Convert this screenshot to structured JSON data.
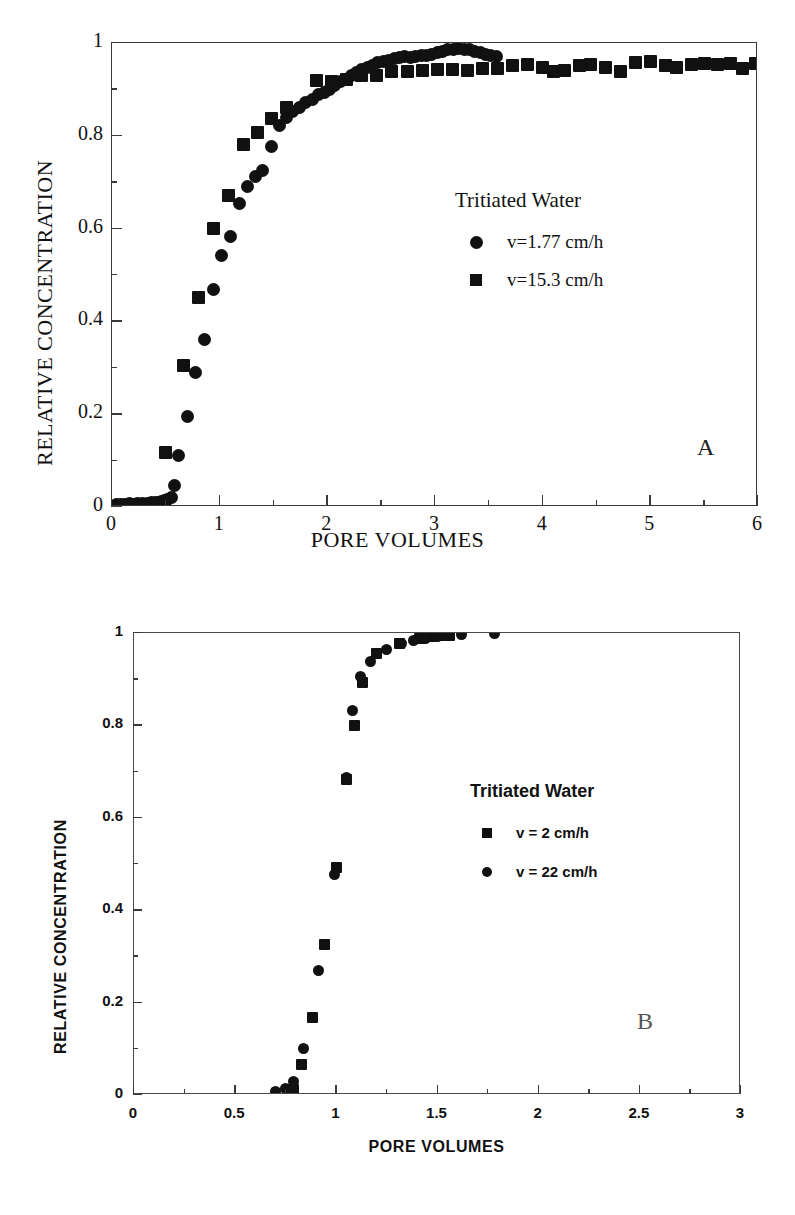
{
  "figure": {
    "panels": [
      "A",
      "B"
    ],
    "background": "#ffffff",
    "ink": "#111111"
  },
  "panelA": {
    "letter": "A",
    "legend": {
      "title": "Tritiated Water",
      "entries": [
        {
          "marker": "circle",
          "label": "v=1.77 cm/h"
        },
        {
          "marker": "square",
          "label": "v=15.3 cm/h"
        }
      ]
    },
    "chart_data": {
      "type": "scatter",
      "title": "",
      "xlabel": "PORE VOLUMES",
      "ylabel": "RELATIVE CONCENTRATION",
      "xlim": [
        0,
        6
      ],
      "ylim": [
        0,
        1
      ],
      "xticks": [
        0,
        1,
        2,
        3,
        4,
        5,
        6
      ],
      "xticklabels": [
        "0",
        "1",
        "2",
        "3",
        "4",
        "5",
        "6"
      ],
      "yticks": [
        0,
        0.2,
        0.4,
        0.6,
        0.8,
        1
      ],
      "yticklabels": [
        "0",
        "0.2",
        "0.4",
        "0.6",
        "0.8",
        "1"
      ],
      "xminorstep": 0.5,
      "yminorstep": 0.1,
      "grid": false,
      "legend_position": "center-right",
      "series": [
        {
          "name": "v=1.77 cm/h",
          "marker": "circle",
          "points": [
            [
              0.04,
              0.005
            ],
            [
              0.08,
              0.006
            ],
            [
              0.12,
              0.006
            ],
            [
              0.16,
              0.007
            ],
            [
              0.2,
              0.006
            ],
            [
              0.24,
              0.007
            ],
            [
              0.28,
              0.008
            ],
            [
              0.33,
              0.007
            ],
            [
              0.37,
              0.009
            ],
            [
              0.4,
              0.01
            ],
            [
              0.43,
              0.01
            ],
            [
              0.46,
              0.012
            ],
            [
              0.49,
              0.013
            ],
            [
              0.52,
              0.016
            ],
            [
              0.55,
              0.02
            ],
            [
              0.58,
              0.047
            ],
            [
              0.62,
              0.112
            ],
            [
              0.7,
              0.196
            ],
            [
              0.78,
              0.289
            ],
            [
              0.86,
              0.362
            ],
            [
              0.94,
              0.468
            ],
            [
              1.02,
              0.543
            ],
            [
              1.1,
              0.582
            ],
            [
              1.18,
              0.655
            ],
            [
              1.26,
              0.69
            ],
            [
              1.33,
              0.712
            ],
            [
              1.4,
              0.725
            ],
            [
              1.48,
              0.776
            ],
            [
              1.56,
              0.822
            ],
            [
              1.62,
              0.84
            ],
            [
              1.68,
              0.852
            ],
            [
              1.74,
              0.862
            ],
            [
              1.8,
              0.872
            ],
            [
              1.86,
              0.879
            ],
            [
              1.92,
              0.888
            ],
            [
              1.97,
              0.893
            ],
            [
              2.02,
              0.9
            ],
            [
              2.07,
              0.908
            ],
            [
              2.12,
              0.916
            ],
            [
              2.17,
              0.922
            ],
            [
              2.22,
              0.93
            ],
            [
              2.27,
              0.936
            ],
            [
              2.32,
              0.942
            ],
            [
              2.37,
              0.948
            ],
            [
              2.42,
              0.952
            ],
            [
              2.47,
              0.957
            ],
            [
              2.52,
              0.96
            ],
            [
              2.57,
              0.963
            ],
            [
              2.62,
              0.967
            ],
            [
              2.67,
              0.968
            ],
            [
              2.72,
              0.97
            ],
            [
              2.77,
              0.969
            ],
            [
              2.82,
              0.971
            ],
            [
              2.87,
              0.972
            ],
            [
              2.92,
              0.974
            ],
            [
              2.97,
              0.976
            ],
            [
              3.02,
              0.979
            ],
            [
              3.07,
              0.982
            ],
            [
              3.12,
              0.985
            ],
            [
              3.17,
              0.987
            ],
            [
              3.22,
              0.988
            ],
            [
              3.27,
              0.986
            ],
            [
              3.32,
              0.985
            ],
            [
              3.37,
              0.982
            ],
            [
              3.42,
              0.979
            ],
            [
              3.47,
              0.976
            ],
            [
              3.52,
              0.973
            ],
            [
              3.57,
              0.97
            ]
          ]
        },
        {
          "name": "v=15.3 cm/h",
          "marker": "square",
          "points": [
            [
              0.5,
              0.118
            ],
            [
              0.66,
              0.305
            ],
            [
              0.8,
              0.452
            ],
            [
              0.94,
              0.6
            ],
            [
              1.08,
              0.672
            ],
            [
              1.22,
              0.782
            ],
            [
              1.35,
              0.808
            ],
            [
              1.48,
              0.838
            ],
            [
              1.62,
              0.862
            ],
            [
              1.9,
              0.92
            ],
            [
              2.04,
              0.916
            ],
            [
              2.18,
              0.922
            ],
            [
              2.32,
              0.93
            ],
            [
              2.46,
              0.931
            ],
            [
              2.6,
              0.938
            ],
            [
              2.74,
              0.939
            ],
            [
              2.88,
              0.941
            ],
            [
              3.02,
              0.943
            ],
            [
              3.16,
              0.943
            ],
            [
              3.3,
              0.94
            ],
            [
              3.44,
              0.944
            ],
            [
              3.58,
              0.946
            ],
            [
              3.72,
              0.952
            ],
            [
              3.86,
              0.954
            ],
            [
              4.0,
              0.948
            ],
            [
              4.1,
              0.938
            ],
            [
              4.2,
              0.94
            ],
            [
              4.34,
              0.952
            ],
            [
              4.44,
              0.953
            ],
            [
              4.58,
              0.947
            ],
            [
              4.72,
              0.938
            ],
            [
              4.86,
              0.958
            ],
            [
              5.0,
              0.961
            ],
            [
              5.14,
              0.952
            ],
            [
              5.24,
              0.948
            ],
            [
              5.38,
              0.953
            ],
            [
              5.5,
              0.955
            ],
            [
              5.62,
              0.954
            ],
            [
              5.74,
              0.955
            ],
            [
              5.86,
              0.946
            ],
            [
              5.98,
              0.955
            ]
          ]
        }
      ]
    }
  },
  "panelB": {
    "letter": "B",
    "legend": {
      "title": "Tritiated Water",
      "entries": [
        {
          "marker": "square",
          "label": "v = 2 cm/h"
        },
        {
          "marker": "circle",
          "label": "v = 22 cm/h"
        }
      ]
    },
    "chart_data": {
      "type": "scatter",
      "title": "",
      "xlabel": "PORE VOLUMES",
      "ylabel": "RELATIVE CONCENTRATION",
      "xlim": [
        0,
        3
      ],
      "ylim": [
        0,
        1
      ],
      "xticks": [
        0,
        0.5,
        1,
        1.5,
        2,
        2.5,
        3
      ],
      "xticklabels": [
        "0",
        "0.5",
        "1",
        "1.5",
        "2",
        "2.5",
        "3"
      ],
      "yticks": [
        0,
        0.2,
        0.4,
        0.6,
        0.8,
        1
      ],
      "yticklabels": [
        "0",
        "0.2",
        "0.4",
        "0.6",
        "0.8",
        "1"
      ],
      "xminorstep": 0.25,
      "yminorstep": 0.1,
      "grid": false,
      "legend_position": "center-right",
      "series": [
        {
          "name": "v = 2 cm/h",
          "marker": "square",
          "points": [
            [
              0.79,
              0.012
            ],
            [
              0.83,
              0.065
            ],
            [
              0.88,
              0.168
            ],
            [
              0.94,
              0.325
            ],
            [
              1.0,
              0.492
            ],
            [
              1.05,
              0.683
            ],
            [
              1.09,
              0.8
            ],
            [
              1.13,
              0.893
            ],
            [
              1.2,
              0.955
            ],
            [
              1.31,
              0.978
            ],
            [
              1.41,
              0.988
            ],
            [
              1.47,
              0.992
            ],
            [
              1.52,
              0.994
            ],
            [
              1.56,
              0.995
            ]
          ]
        },
        {
          "name": "v = 22 cm/h",
          "marker": "circle",
          "points": [
            [
              0.7,
              0.008
            ],
            [
              0.75,
              0.014
            ],
            [
              0.79,
              0.03
            ],
            [
              0.84,
              0.101
            ],
            [
              0.91,
              0.27
            ],
            [
              0.99,
              0.478
            ],
            [
              1.05,
              0.688
            ],
            [
              1.08,
              0.833
            ],
            [
              1.12,
              0.905
            ],
            [
              1.17,
              0.938
            ],
            [
              1.25,
              0.965
            ],
            [
              1.32,
              0.977
            ],
            [
              1.38,
              0.984
            ],
            [
              1.44,
              0.989
            ],
            [
              1.5,
              0.992
            ],
            [
              1.55,
              0.994
            ],
            [
              1.62,
              0.997
            ],
            [
              1.78,
              0.998
            ]
          ]
        }
      ]
    }
  }
}
